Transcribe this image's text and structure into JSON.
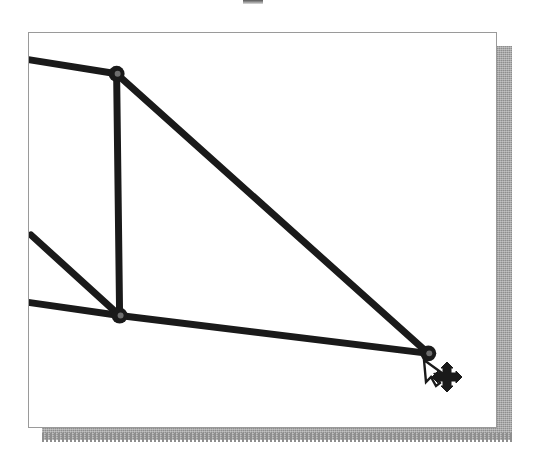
{
  "app": {
    "title": "Truss Geometry Editor Canvas",
    "description": "Scanned figure of a structural truss / linkage being edited; three pin joints connected by thick members, with a mouse pointer and a four-way move cursor over the lower-right joint."
  },
  "canvas": {
    "name": "drawing-canvas",
    "background_color": "#ffffff",
    "border_color": "#9a9a9a",
    "shadow_color": "#8e8e8e",
    "width": 469,
    "height": 396,
    "origin_x": 28,
    "origin_y": 32
  },
  "ink": {
    "member_color": "#1a1a1a",
    "member_width": 7,
    "joint_fill": "#1a1a1a",
    "joint_hole": "#6e6e6e",
    "joint_radius": 8
  },
  "joints": [
    {
      "id": "A",
      "label": "joint-top",
      "x": 88,
      "y": 41
    },
    {
      "id": "B",
      "label": "joint-middle",
      "x": 91,
      "y": 284
    },
    {
      "id": "C",
      "label": "joint-right",
      "x": 401,
      "y": 322
    }
  ],
  "anchors": [
    {
      "id": "P1",
      "label": "edge-anchor-top-left",
      "x": 1,
      "y": 27
    },
    {
      "id": "P2",
      "label": "edge-anchor-mid-left",
      "x": 2,
      "y": 203
    },
    {
      "id": "P3",
      "label": "edge-anchor-lower-left",
      "x": 1,
      "y": 271
    }
  ],
  "members": [
    {
      "id": "M1",
      "label": "member-topleft-to-A",
      "from": "P1",
      "to": "A"
    },
    {
      "id": "M2",
      "label": "member-A-to-B",
      "from": "A",
      "to": "B"
    },
    {
      "id": "M3",
      "label": "member-A-to-C",
      "from": "A",
      "to": "C"
    },
    {
      "id": "M4",
      "label": "member-midleft-to-B",
      "from": "P2",
      "to": "B"
    },
    {
      "id": "M5",
      "label": "member-lowerleft-to-B",
      "from": "P3",
      "to": "B"
    },
    {
      "id": "M6",
      "label": "member-B-to-C",
      "from": "B",
      "to": "C"
    }
  ],
  "cursor": {
    "pointer": {
      "name": "arrow-pointer",
      "x": 424,
      "y": 360,
      "fill": "#ffffff",
      "stroke": "#1a1a1a"
    },
    "move": {
      "name": "move-four-arrows-cursor",
      "x": 447,
      "y": 377,
      "fill": "#1a1a1a",
      "tooltip": "Drag to move joint"
    }
  },
  "status": {
    "selected_joint": "C",
    "mode": "Move"
  }
}
